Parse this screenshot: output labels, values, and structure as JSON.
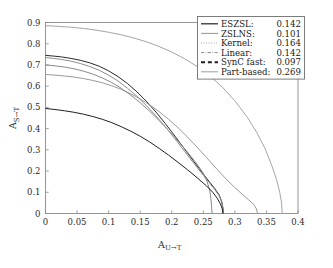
{
  "figure": {
    "background": "#ffffff",
    "frame_color": "#8a8a8a"
  },
  "axes": {
    "x_title": "A",
    "x_subscript": "U→T",
    "y_title": "A",
    "y_subscript": "S→T",
    "x_ticks": [
      "0",
      "0.05",
      "0.1",
      "0.15",
      "0.2",
      "0.25",
      "0.3",
      "0.35",
      "0.4"
    ],
    "y_ticks": [
      "0",
      "0.1",
      "0.2",
      "0.3",
      "0.4",
      "0.5",
      "0.6",
      "0.7",
      "0.8",
      "0.9"
    ]
  },
  "legend": {
    "rows": [
      {
        "label": "ESZSL:",
        "value": "0.142",
        "style": "solid",
        "color": "#2a2a2a",
        "width": 1.25
      },
      {
        "label": "ZSLNS:",
        "value": "0.101",
        "style": "solid",
        "color": "#8f8f8f",
        "width": 0.95
      },
      {
        "label": "Kernel:",
        "value": "0.164",
        "style": "dotted",
        "color": "#9a9a9a",
        "width": 1.0
      },
      {
        "label": "Linear:",
        "value": "0.142",
        "style": "dashdot",
        "color": "#8a8a8a",
        "width": 1.0
      },
      {
        "label": "SynC fast:",
        "value": "0.097",
        "style": "dashed",
        "color": "#1f1f1f",
        "width": 1.9
      },
      {
        "label": "Part-based:",
        "value": "0.269",
        "style": "solid",
        "color": "#a5a5a5",
        "width": 1.1
      }
    ]
  },
  "chart_data": {
    "type": "line",
    "title": "",
    "xlabel": "A_{U→T}",
    "ylabel": "A_{S→T}",
    "xlim": [
      0,
      0.4
    ],
    "ylim": [
      0,
      0.9
    ],
    "grid": false,
    "legend_position": "top-right",
    "annotation": "Legend values are AUSUC (Area Under Seen-Unseen accuracy Curve)",
    "series": [
      {
        "name": "ESZSL",
        "auc": 0.142,
        "style": "solid",
        "color": "#2a2a2a",
        "points": [
          [
            0.0,
            0.745
          ],
          [
            0.012,
            0.742
          ],
          [
            0.025,
            0.738
          ],
          [
            0.04,
            0.731
          ],
          [
            0.055,
            0.722
          ],
          [
            0.07,
            0.71
          ],
          [
            0.085,
            0.694
          ],
          [
            0.1,
            0.672
          ],
          [
            0.115,
            0.645
          ],
          [
            0.13,
            0.612
          ],
          [
            0.145,
            0.573
          ],
          [
            0.16,
            0.528
          ],
          [
            0.175,
            0.478
          ],
          [
            0.19,
            0.423
          ],
          [
            0.205,
            0.365
          ],
          [
            0.22,
            0.305
          ],
          [
            0.235,
            0.245
          ],
          [
            0.25,
            0.186
          ],
          [
            0.26,
            0.148
          ],
          [
            0.268,
            0.118
          ],
          [
            0.275,
            0.088
          ],
          [
            0.279,
            0.058
          ],
          [
            0.281,
            0.028
          ],
          [
            0.282,
            0.0
          ]
        ]
      },
      {
        "name": "ZSLNS",
        "auc": 0.101,
        "style": "solid",
        "color": "#8f8f8f",
        "points": [
          [
            0.0,
            0.735
          ],
          [
            0.012,
            0.731
          ],
          [
            0.025,
            0.726
          ],
          [
            0.04,
            0.718
          ],
          [
            0.055,
            0.707
          ],
          [
            0.07,
            0.693
          ],
          [
            0.085,
            0.675
          ],
          [
            0.1,
            0.652
          ],
          [
            0.115,
            0.624
          ],
          [
            0.13,
            0.59
          ],
          [
            0.145,
            0.552
          ],
          [
            0.16,
            0.508
          ],
          [
            0.175,
            0.46
          ],
          [
            0.19,
            0.408
          ],
          [
            0.205,
            0.352
          ],
          [
            0.22,
            0.294
          ],
          [
            0.235,
            0.236
          ],
          [
            0.25,
            0.18
          ],
          [
            0.26,
            0.143
          ],
          [
            0.268,
            0.113
          ],
          [
            0.275,
            0.084
          ],
          [
            0.279,
            0.054
          ],
          [
            0.281,
            0.026
          ],
          [
            0.282,
            0.0
          ]
        ]
      },
      {
        "name": "Kernel",
        "auc": 0.164,
        "style": "dotted",
        "color": "#9a9a9a",
        "points": [
          [
            0.0,
            0.655
          ],
          [
            0.015,
            0.652
          ],
          [
            0.03,
            0.648
          ],
          [
            0.045,
            0.643
          ],
          [
            0.06,
            0.636
          ],
          [
            0.075,
            0.627
          ],
          [
            0.09,
            0.616
          ],
          [
            0.105,
            0.602
          ],
          [
            0.12,
            0.585
          ],
          [
            0.135,
            0.564
          ],
          [
            0.15,
            0.54
          ],
          [
            0.165,
            0.512
          ],
          [
            0.18,
            0.48
          ],
          [
            0.195,
            0.444
          ],
          [
            0.21,
            0.404
          ],
          [
            0.225,
            0.36
          ],
          [
            0.24,
            0.313
          ],
          [
            0.255,
            0.264
          ],
          [
            0.27,
            0.214
          ],
          [
            0.285,
            0.166
          ],
          [
            0.3,
            0.122
          ],
          [
            0.312,
            0.09
          ],
          [
            0.322,
            0.064
          ],
          [
            0.33,
            0.042
          ],
          [
            0.334,
            0.022
          ],
          [
            0.336,
            0.0
          ]
        ]
      },
      {
        "name": "Linear",
        "auc": 0.142,
        "style": "dashdot",
        "color": "#8a8a8a",
        "points": [
          [
            0.0,
            0.7
          ],
          [
            0.015,
            0.696
          ],
          [
            0.03,
            0.69
          ],
          [
            0.045,
            0.682
          ],
          [
            0.06,
            0.671
          ],
          [
            0.075,
            0.657
          ],
          [
            0.09,
            0.639
          ],
          [
            0.105,
            0.617
          ],
          [
            0.12,
            0.59
          ],
          [
            0.135,
            0.558
          ],
          [
            0.15,
            0.522
          ],
          [
            0.165,
            0.482
          ],
          [
            0.18,
            0.438
          ],
          [
            0.195,
            0.391
          ],
          [
            0.21,
            0.341
          ],
          [
            0.225,
            0.289
          ],
          [
            0.24,
            0.233
          ],
          [
            0.25,
            0.19
          ],
          [
            0.256,
            0.15
          ],
          [
            0.26,
            0.11
          ],
          [
            0.262,
            0.07
          ],
          [
            0.263,
            0.035
          ],
          [
            0.264,
            0.0
          ]
        ]
      },
      {
        "name": "SynC fast",
        "auc": 0.097,
        "style": "dashed",
        "color": "#1f1f1f",
        "points": [
          [
            0.0,
            0.495
          ],
          [
            0.015,
            0.49
          ],
          [
            0.03,
            0.484
          ],
          [
            0.045,
            0.477
          ],
          [
            0.06,
            0.468
          ],
          [
            0.075,
            0.457
          ],
          [
            0.09,
            0.444
          ],
          [
            0.105,
            0.428
          ],
          [
            0.12,
            0.409
          ],
          [
            0.135,
            0.388
          ],
          [
            0.15,
            0.364
          ],
          [
            0.165,
            0.337
          ],
          [
            0.18,
            0.307
          ],
          [
            0.195,
            0.275
          ],
          [
            0.21,
            0.241
          ],
          [
            0.225,
            0.206
          ],
          [
            0.24,
            0.169
          ],
          [
            0.255,
            0.13
          ],
          [
            0.265,
            0.1
          ],
          [
            0.272,
            0.072
          ],
          [
            0.277,
            0.046
          ],
          [
            0.28,
            0.022
          ],
          [
            0.281,
            0.0
          ]
        ]
      },
      {
        "name": "Part-based",
        "auc": 0.269,
        "style": "solid",
        "color": "#a5a5a5",
        "points": [
          [
            0.0,
            0.885
          ],
          [
            0.02,
            0.882
          ],
          [
            0.04,
            0.878
          ],
          [
            0.06,
            0.872
          ],
          [
            0.08,
            0.864
          ],
          [
            0.1,
            0.854
          ],
          [
            0.12,
            0.842
          ],
          [
            0.14,
            0.827
          ],
          [
            0.16,
            0.809
          ],
          [
            0.18,
            0.787
          ],
          [
            0.2,
            0.761
          ],
          [
            0.22,
            0.73
          ],
          [
            0.24,
            0.693
          ],
          [
            0.26,
            0.649
          ],
          [
            0.28,
            0.596
          ],
          [
            0.3,
            0.531
          ],
          [
            0.32,
            0.452
          ],
          [
            0.335,
            0.38
          ],
          [
            0.348,
            0.305
          ],
          [
            0.358,
            0.23
          ],
          [
            0.366,
            0.16
          ],
          [
            0.371,
            0.1
          ],
          [
            0.374,
            0.05
          ],
          [
            0.375,
            0.0
          ]
        ]
      }
    ]
  }
}
